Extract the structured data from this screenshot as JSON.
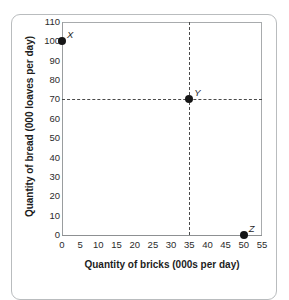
{
  "chart_data": {
    "type": "scatter",
    "title": "",
    "xlabel": "Quantity of bricks (000s per day)",
    "ylabel": "Quantity of bread (000 loaves per day)",
    "xlim": [
      0,
      55
    ],
    "ylim": [
      0,
      110
    ],
    "xticks": [
      0,
      5,
      10,
      15,
      20,
      25,
      30,
      35,
      40,
      45,
      50,
      55
    ],
    "yticks": [
      0,
      10,
      20,
      30,
      40,
      50,
      60,
      70,
      80,
      90,
      100,
      110
    ],
    "grid": false,
    "legend": "none",
    "points": [
      {
        "label": "X",
        "x": 0,
        "y": 100
      },
      {
        "label": "Y",
        "x": 35,
        "y": 70
      },
      {
        "label": "Z",
        "x": 50,
        "y": 0
      }
    ],
    "annotations": [
      {
        "kind": "dashed-line",
        "orientation": "horizontal",
        "value": 70,
        "from": 0,
        "to": 55
      },
      {
        "kind": "dashed-line",
        "orientation": "vertical",
        "value": 35,
        "from": 0,
        "to": 110
      }
    ],
    "colors": {
      "point": "#161616",
      "guide": "#4a4a4a",
      "axis": "#9a9d9f",
      "text": "#1d1d1d",
      "card_border": "#b9bcbe",
      "background": "#ffffff"
    }
  }
}
